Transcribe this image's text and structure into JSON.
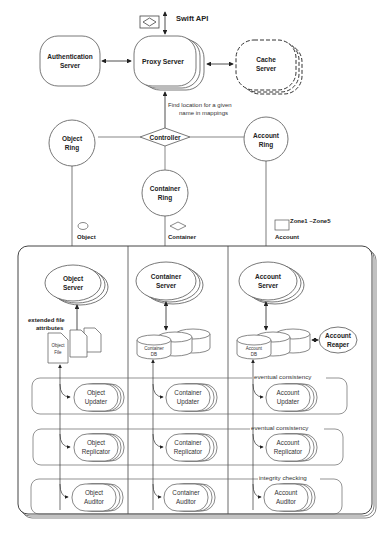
{
  "diagram": {
    "top": {
      "swift_api": "Swift API",
      "auth": [
        "Authentication",
        "Server"
      ],
      "proxy": "Proxy Server",
      "cache": [
        "Cache",
        "Server"
      ],
      "find_note": [
        "Find location for  a given",
        "name in mappings"
      ],
      "controller": "Controller"
    },
    "rings": {
      "object": [
        "Object",
        "Ring"
      ],
      "container": [
        "Container",
        "Ring"
      ],
      "account": [
        "Account",
        "Ring"
      ]
    },
    "legend": {
      "object": "Object",
      "container": "Container",
      "account": "Account",
      "zones": "Zone1 ~Zone5"
    },
    "servers": {
      "object": [
        "Object",
        "Server"
      ],
      "container": [
        "Container",
        "Server"
      ],
      "account": [
        "Account",
        "Server"
      ]
    },
    "storage": {
      "ext_attr": [
        "extended file",
        "attributes"
      ],
      "object_file": [
        "Object",
        "File"
      ],
      "container_db": [
        "Container",
        "DB"
      ],
      "account_db": [
        "Account",
        "DB"
      ],
      "reaper": [
        "Account",
        "Reaper"
      ]
    },
    "rows": [
      {
        "note": "eventual consistency",
        "items": [
          [
            "Object",
            "Updater"
          ],
          [
            "Container",
            "Updater"
          ],
          [
            "Account",
            "Updater"
          ]
        ]
      },
      {
        "note": "eventual consistency",
        "items": [
          [
            "Object",
            "Replicator"
          ],
          [
            "Container",
            "Replicator"
          ],
          [
            "Account",
            "Replicator"
          ]
        ]
      },
      {
        "note": "integrity checking",
        "items": [
          [
            "Object",
            "Auditor"
          ],
          [
            "Container",
            "Auditor"
          ],
          [
            "Account",
            "Auditor"
          ]
        ]
      }
    ]
  }
}
